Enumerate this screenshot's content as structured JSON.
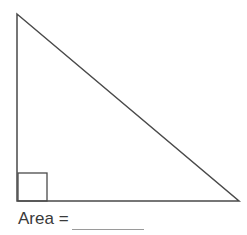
{
  "diagram": {
    "shape": "right triangle",
    "vertices": {
      "top": [
        17,
        14
      ],
      "bottom_left": [
        17,
        201
      ],
      "bottom_right": [
        239,
        201
      ]
    },
    "right_angle_marker": {
      "x": 18,
      "y": 173,
      "size": 29
    },
    "stroke_color": "#4a4a4a",
    "marker_color": "#4a4a4a"
  },
  "answer": {
    "label": "Area =",
    "blank_value": ""
  }
}
